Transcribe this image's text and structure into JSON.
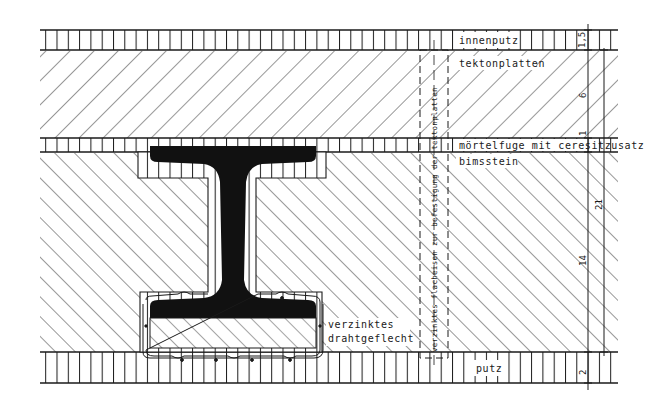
{
  "drawing": {
    "type": "construction section detail",
    "colors": {
      "ink": "#1a1a1a",
      "paper": "#ffffff",
      "steel": "#111111"
    },
    "layers": [
      {
        "id": "innenputz",
        "label": "innenputz",
        "hatch": "vertical",
        "dimension": "1,5"
      },
      {
        "id": "tektonplatten",
        "label": "tektonplatten",
        "hatch": "diagonal-down",
        "dimension": "6"
      },
      {
        "id": "moertelfuge",
        "label": "mörtelfuge mit ceresitzusatz",
        "hatch": "vertical",
        "dimension": "1"
      },
      {
        "id": "bimsstein",
        "label": "bimsstein",
        "hatch": "diagonal-up",
        "dimension": "14"
      },
      {
        "id": "putz",
        "label": "putz",
        "hatch": "vertical",
        "dimension": "2"
      }
    ],
    "dimensions": {
      "inner_chain": [
        "1,5",
        "6",
        "1",
        "14",
        "2"
      ],
      "outer_chain": [
        "21"
      ]
    },
    "annotations": {
      "vertical_note": "verzinktes flacheisen zur befestigung der tektonplatten",
      "mesh_note_line1": "verzinktes",
      "mesh_note_line2": "drahtgeflecht"
    },
    "beam": {
      "type": "I-beam (steel profile)",
      "encasement": "bimsstein with galvanised wire mesh"
    }
  }
}
